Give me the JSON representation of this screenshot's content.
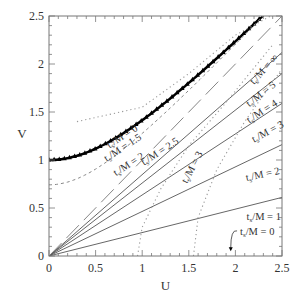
{
  "chart_data": {
    "type": "line",
    "title": "",
    "xlabel": "U",
    "ylabel": "V",
    "xlim": [
      0,
      2.5
    ],
    "ylim": [
      0,
      2.5
    ],
    "grid": false,
    "x_ticks": [
      "0",
      "0.5",
      "1",
      "1.5",
      "2",
      "2.5"
    ],
    "y_ticks": [
      "0",
      "0.5",
      "1",
      "1.5",
      "2",
      "2.5"
    ],
    "series": [
      {
        "name": "t/M = 0 (V = sqrt(1+U^2))",
        "style": "thick-triangles",
        "label": "t_s/M = 0",
        "U": [
          0,
          0.5,
          1.0,
          1.5,
          2.0,
          2.29
        ],
        "V": [
          1.0,
          1.12,
          1.41,
          1.8,
          2.24,
          2.5
        ]
      },
      {
        "name": "t/M = 1",
        "style": "solid",
        "label": "t_s/M = 1",
        "U": [
          0,
          2.5
        ],
        "V": [
          0,
          0.61
        ]
      },
      {
        "name": "t/M = 2",
        "style": "solid",
        "label": "t_s/M = 2",
        "U": [
          0,
          2.5
        ],
        "V": [
          0,
          1.16
        ]
      },
      {
        "name": "t/M = 3",
        "style": "solid",
        "label": "t_s/M = 3",
        "U": [
          0,
          2.5
        ],
        "V": [
          0,
          1.59
        ]
      },
      {
        "name": "t/M = 4",
        "style": "solid",
        "label": "t_s/M = 4",
        "U": [
          0,
          2.5
        ],
        "V": [
          0,
          1.9
        ]
      },
      {
        "name": "t/M = 5",
        "style": "solid",
        "label": "t_s/M = 5",
        "U": [
          0,
          2.5
        ],
        "V": [
          0,
          2.12
        ]
      },
      {
        "name": "t/M = inf",
        "style": "long-dash",
        "label": "t_s/M = ∞",
        "U": [
          0,
          2.5
        ],
        "V": [
          0,
          2.5
        ]
      },
      {
        "name": "t_s/M = 1.5 surface",
        "style": "dashed",
        "label": "t_s/M = 1.5",
        "U": [
          0,
          0.5,
          1.0,
          1.5,
          2.0,
          2.5
        ],
        "V": [
          0.74,
          0.9,
          1.25,
          1.67,
          2.13,
          2.6
        ]
      },
      {
        "name": "t_s/M = 2 surface",
        "style": "dotted",
        "label": "t_s/M = 2",
        "U": [
          0.3,
          1.0,
          1.5,
          2.0,
          2.38
        ],
        "V": [
          1.4,
          1.55,
          1.9,
          2.3,
          2.5
        ]
      },
      {
        "name": "t_s/M = 2.5 surface",
        "style": "dotted",
        "label": "t_s/M = 2.5",
        "U": [
          0.95,
          1.0,
          1.2,
          1.5,
          1.9,
          2.4
        ],
        "V": [
          0,
          0.3,
          0.7,
          1.15,
          1.6,
          2.2
        ]
      },
      {
        "name": "t_s/M = 3 surface",
        "style": "dotted",
        "label": "t_s/M = 3",
        "U": [
          1.55,
          1.6,
          1.8,
          2.1,
          2.5
        ],
        "V": [
          0,
          0.4,
          0.9,
          1.4,
          1.95
        ]
      }
    ],
    "annotations": [
      {
        "text": "t_s/M = 0",
        "U": 2.05,
        "V": 0.22,
        "arrow_to": [
          1.95,
          0.05
        ]
      }
    ]
  },
  "labels": {
    "x_axis": "U",
    "y_axis": "V",
    "ts0_top": "t",
    "ts15": "t",
    "ts2": "t"
  }
}
